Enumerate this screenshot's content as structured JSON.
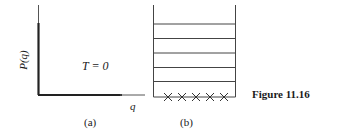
{
  "figure": {
    "caption": "Figure 11.16",
    "panel_a": {
      "label": "(a)",
      "y_axis_label": "P(q)",
      "x_axis_label": "q",
      "annotation": "T = 0"
    },
    "panel_b": {
      "label": "(b)",
      "levels": 5,
      "ground_markers": "×–×–×–×–×"
    }
  }
}
